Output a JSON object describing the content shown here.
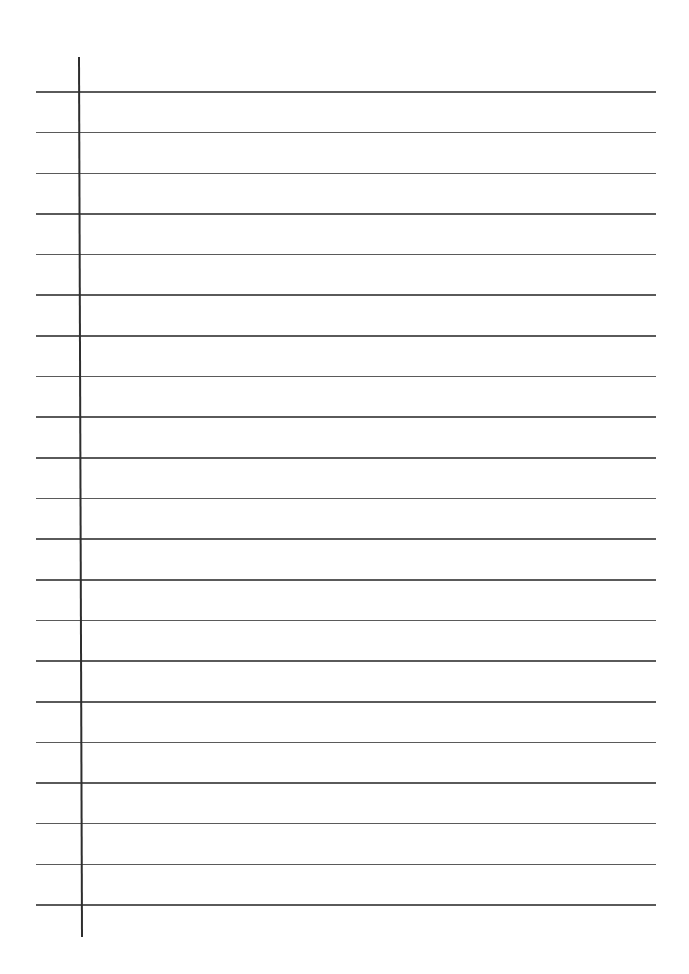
{
  "page": {
    "type": "ruled-notebook-sheet",
    "width": 689,
    "height": 974,
    "background": "#ffffff"
  },
  "rules": {
    "count": 21,
    "first_y": 92,
    "spacing": 40.65,
    "x_start": 36,
    "x_end": 656,
    "color": "#5a5a5a"
  },
  "margin_line": {
    "x_top": 78,
    "x_bottom": 81,
    "y_top": 57,
    "y_bottom": 937,
    "color": "#2e2e2e"
  }
}
